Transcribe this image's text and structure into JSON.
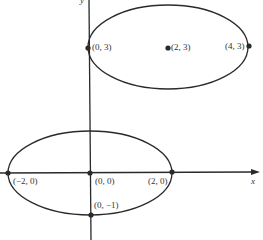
{
  "diagram": {
    "type": "coordinate-plot-ellipses",
    "axes": {
      "x_label": "x",
      "y_label": "y"
    },
    "ellipses": [
      {
        "name": "upper-ellipse",
        "center": "(2, 3)",
        "vertices": [
          "(0, 3)",
          "(4, 3)"
        ]
      },
      {
        "name": "lower-ellipse",
        "center": "(0, 0)",
        "vertices": [
          "(−2, 0)",
          "(2, 0)"
        ],
        "co_vertex": "(0, −1)"
      }
    ],
    "labels": {
      "p03": "(0, 3)",
      "p23": "(2, 3)",
      "p43": "(4, 3)",
      "pm20": "(−2, 0)",
      "p00": "(0, 0)",
      "p20": "(2, 0)",
      "p0m1": "(0, −1)"
    },
    "colors": {
      "stroke": "#2a2a2a",
      "background": "#ffffff"
    }
  }
}
